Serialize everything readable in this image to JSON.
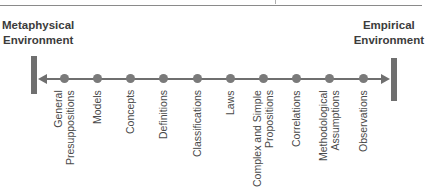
{
  "diagram": {
    "left_environment": {
      "line1": "Metaphysical",
      "line2": "Environment"
    },
    "right_environment": {
      "line1": "Empirical",
      "line2": "Environment"
    },
    "arrow": "bidirectional",
    "colors": {
      "line": "#6f6f6f",
      "dot": "#7a7a7a",
      "bar": "#6f6f6f",
      "text": "#3a3a3a"
    },
    "stages": [
      {
        "lines": [
          "General",
          "Presuppositions"
        ],
        "x": 64
      },
      {
        "lines": [
          "Models"
        ],
        "x": 97
      },
      {
        "lines": [
          "Concepts"
        ],
        "x": 130
      },
      {
        "lines": [
          "Definitions"
        ],
        "x": 163
      },
      {
        "lines": [
          "Classifications"
        ],
        "x": 197
      },
      {
        "lines": [
          "Laws"
        ],
        "x": 230
      },
      {
        "lines": [
          "Complex and Simple",
          "Propositions"
        ],
        "x": 263
      },
      {
        "lines": [
          "Correlations"
        ],
        "x": 296
      },
      {
        "lines": [
          "Methodological",
          "Assumptions"
        ],
        "x": 329
      },
      {
        "lines": [
          "Observations"
        ],
        "x": 363
      }
    ]
  }
}
